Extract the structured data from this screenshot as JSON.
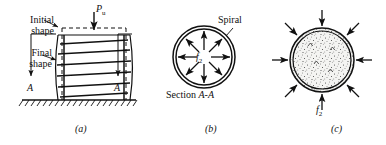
{
  "figure": {
    "caption_a": "(a)",
    "caption_b": "(b)",
    "caption_c": "(c)"
  },
  "panel_a": {
    "label_initial_line1": "Initial",
    "label_initial_line2": "shape",
    "label_final_line1": "Final",
    "label_final_line2": "shape",
    "load_symbol": "P",
    "load_subscript": "u",
    "section_mark_left": "A",
    "section_mark_right": "A"
  },
  "panel_b": {
    "label_spiral": "Spiral",
    "label_section": "Section ",
    "label_section_a1": "A",
    "label_section_dash": "-",
    "label_section_a2": "A",
    "stress_symbol": "f",
    "stress_subscript": "2",
    "arrow_count": 8,
    "arrow_direction": "outward"
  },
  "panel_c": {
    "stress_symbol": "f",
    "stress_subscript": "2",
    "arrow_count": 8,
    "arrow_direction": "inward"
  },
  "colors": {
    "ink": "#111111",
    "paper": "#ffffff",
    "concrete_fill": "#f2f2f0"
  }
}
